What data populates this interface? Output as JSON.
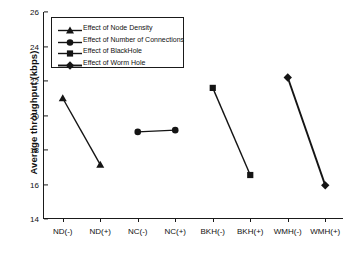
{
  "chart_data": {
    "type": "line",
    "title": "",
    "xlabel": "",
    "ylabel": "Average throughput (kbps)",
    "categories": [
      "ND(-)",
      "ND(+)",
      "NC(-)",
      "NC(+)",
      "BKH(-)",
      "BKH(+)",
      "WMH(-)",
      "WMH(+)"
    ],
    "ylim": [
      14,
      26
    ],
    "yticks": [
      14,
      16,
      18,
      20,
      22,
      24,
      26
    ],
    "ytick_labels": [
      "14",
      "16",
      "18",
      "20",
      "22",
      "24",
      "26"
    ],
    "grid": false,
    "legend_position": "upper-left",
    "series": [
      {
        "name": "Effect of Node Density",
        "marker": "triangle",
        "color": "#141414",
        "x": [
          "ND(-)",
          "ND(+)"
        ],
        "values": [
          21.0,
          17.15
        ]
      },
      {
        "name": "Effect of Number of Connections",
        "marker": "circle",
        "color": "#141414",
        "x": [
          "NC(-)",
          "NC(+)"
        ],
        "values": [
          19.05,
          19.15
        ]
      },
      {
        "name": "Effect of BlackHole",
        "marker": "square",
        "color": "#141414",
        "x": [
          "BKH(-)",
          "BKH(+)"
        ],
        "values": [
          21.6,
          16.55
        ]
      },
      {
        "name": "Effect of Worm Hole",
        "marker": "diamond",
        "color": "#141414",
        "x": [
          "WMH(-)",
          "WMH(+)"
        ],
        "values": [
          22.2,
          15.95
        ]
      }
    ]
  },
  "legend": {
    "items": [
      {
        "label": "Effect of Node Density"
      },
      {
        "label": "Effect of Number of Connections"
      },
      {
        "label": "Effect of BlackHole"
      },
      {
        "label": "Effect of Worm Hole"
      }
    ]
  }
}
